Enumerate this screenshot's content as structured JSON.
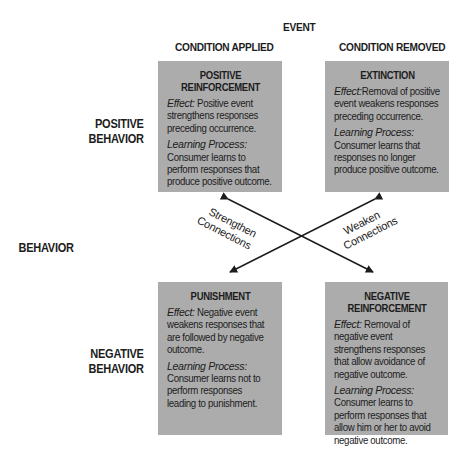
{
  "header": {
    "event": "EVENT",
    "col_applied": "CONDITION APPLIED",
    "col_removed": "CONDITION REMOVED"
  },
  "rows": {
    "axis_label": "BEHAVIOR",
    "positive_line1": "POSITIVE",
    "positive_line2": "BEHAVIOR",
    "negative_line1": "NEGATIVE",
    "negative_line2": "BEHAVIOR"
  },
  "boxes": {
    "positive_reinforcement": {
      "title1": "POSITIVE",
      "title2": "REINFORCEMENT",
      "effect_label": "Effect:",
      "effect_text": " Positive event strengthens responses preceding occurrence.",
      "learning_label": "Learning Process:",
      "learning_text": "Consumer learns to perform responses that produce positive outcome."
    },
    "extinction": {
      "title1": "EXTINCTION",
      "effect_label": "Effect:",
      "effect_text": "Removal of positive event weakens responses preceding occurrence.",
      "learning_label": "Learning Process:",
      "learning_text": "Consumer learns that responses no longer produce positive outcome."
    },
    "punishment": {
      "title1": "PUNISHMENT",
      "effect_label": "Effect:",
      "effect_text": " Negative event weakens responses that are followed by negative outcome.",
      "learning_label": "Learning Process:",
      "learning_text": "Consumer learns not to perform responses leading to punishment."
    },
    "negative_reinforcement": {
      "title1": "NEGATIVE",
      "title2": "REINFORCEMENT",
      "effect_label": "Effect:",
      "effect_text": " Removal of negative event strengthens responses that allow avoidance of negative outcome.",
      "learning_label": "Learning Process:",
      "learning_text": "Consumer learns to  perform responses that allow him or her to avoid  negative outcome."
    }
  },
  "connectors": {
    "strengthen_line1": "Strengthen",
    "strengthen_line2": "Connections",
    "weaken_line1": "Weaken",
    "weaken_line2": "Connections"
  },
  "colors": {
    "box_fill": "#acacac",
    "text": "#1c1c1c",
    "arrow": "#1c1c1c"
  }
}
